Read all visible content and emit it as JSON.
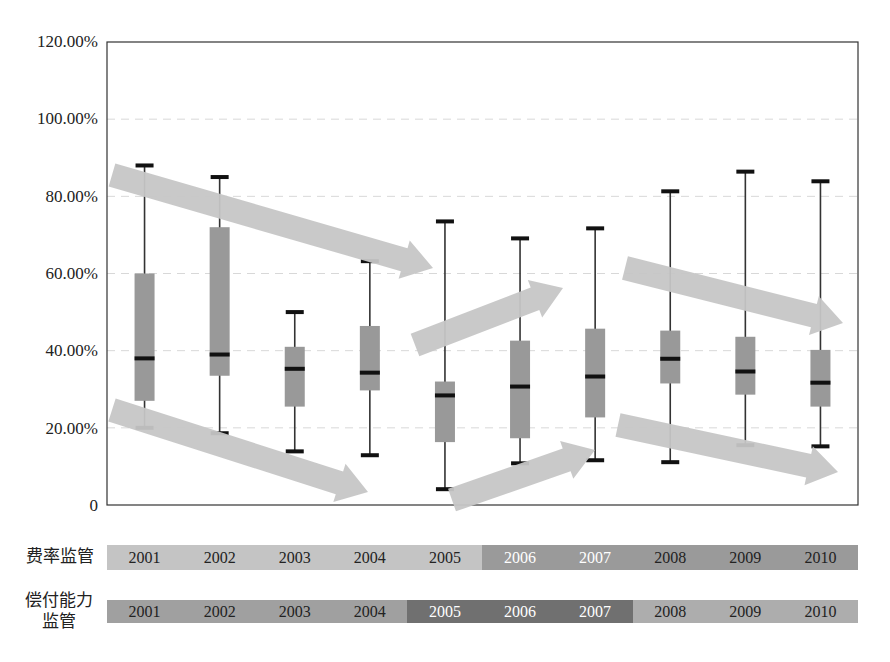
{
  "chart_data": {
    "type": "boxplot",
    "title": "",
    "xlabel": "",
    "ylabel": "",
    "ylim": [
      0,
      1.2
    ],
    "y_ticks": [
      "0",
      "20.00%",
      "40.00%",
      "60.00%",
      "80.00%",
      "100.00%",
      "120.00%"
    ],
    "grid": "horizontal dashed",
    "categories": [
      "2001",
      "2002",
      "2003",
      "2004",
      "2005",
      "2006",
      "2007",
      "2008",
      "2009",
      "2010"
    ],
    "boxes": [
      {
        "year": "2001",
        "max": 0.88,
        "q3": 0.6,
        "median": 0.38,
        "q1": 0.27,
        "min": 0.2
      },
      {
        "year": "2002",
        "max": 0.85,
        "q3": 0.72,
        "median": 0.39,
        "q1": 0.335,
        "min": 0.186
      },
      {
        "year": "2003",
        "max": 0.5,
        "q3": 0.41,
        "median": 0.353,
        "q1": 0.255,
        "min": 0.139
      },
      {
        "year": "2004",
        "max": 0.632,
        "q3": 0.464,
        "median": 0.343,
        "q1": 0.297,
        "min": 0.129
      },
      {
        "year": "2005",
        "max": 0.735,
        "q3": 0.32,
        "median": 0.284,
        "q1": 0.163,
        "min": 0.041
      },
      {
        "year": "2006",
        "max": 0.691,
        "q3": 0.426,
        "median": 0.307,
        "q1": 0.173,
        "min": 0.108
      },
      {
        "year": "2007",
        "max": 0.717,
        "q3": 0.457,
        "median": 0.333,
        "q1": 0.227,
        "min": 0.116
      },
      {
        "year": "2008",
        "max": 0.813,
        "q3": 0.452,
        "median": 0.379,
        "q1": 0.315,
        "min": 0.111
      },
      {
        "year": "2009",
        "max": 0.864,
        "q3": 0.436,
        "median": 0.346,
        "q1": 0.286,
        "min": 0.155
      },
      {
        "year": "2010",
        "max": 0.839,
        "q3": 0.402,
        "median": 0.317,
        "q1": 0.255,
        "min": 0.152
      }
    ],
    "annotations": [
      {
        "type": "arrow",
        "direction": "down",
        "from": [
          112,
          175
        ],
        "to": [
          433,
          268
        ]
      },
      {
        "type": "arrow",
        "direction": "down",
        "from": [
          112,
          410
        ],
        "to": [
          368,
          492
        ]
      },
      {
        "type": "arrow",
        "direction": "up",
        "from": [
          415,
          345
        ],
        "to": [
          563,
          288
        ]
      },
      {
        "type": "arrow",
        "direction": "up",
        "from": [
          452,
          500
        ],
        "to": [
          595,
          450
        ]
      },
      {
        "type": "arrow",
        "direction": "down",
        "from": [
          625,
          268
        ],
        "to": [
          843,
          323
        ]
      },
      {
        "type": "arrow",
        "direction": "down",
        "from": [
          618,
          425
        ],
        "to": [
          838,
          472
        ]
      }
    ],
    "timelines": [
      {
        "label": "费率监管",
        "segments": [
          {
            "years": [
              "2001",
              "2002",
              "2003",
              "2004",
              "2005"
            ],
            "color": "#c4c4c4",
            "text_color": "#222222"
          },
          {
            "years": [
              "2006",
              "2007"
            ],
            "color": "#9a9a9a",
            "text_color": "#ffffff"
          },
          {
            "years": [
              "2008",
              "2009",
              "2010"
            ],
            "color": "#9a9a9a",
            "text_color": "#222222"
          }
        ]
      },
      {
        "label": "偿付能力监管",
        "segments": [
          {
            "years": [
              "2001",
              "2002",
              "2003",
              "2004"
            ],
            "color": "#a0a0a0",
            "text_color": "#222222"
          },
          {
            "years": [
              "2005",
              "2006",
              "2007"
            ],
            "color": "#707070",
            "text_color": "#ffffff"
          },
          {
            "years": [
              "2008",
              "2009",
              "2010"
            ],
            "color": "#adadad",
            "text_color": "#222222"
          }
        ]
      }
    ]
  },
  "y_labels": {
    "t0": "0",
    "t20": "20.00%",
    "t40": "40.00%",
    "t60": "60.00%",
    "t80": "80.00%",
    "t100": "100.00%",
    "t120": "120.00%"
  },
  "timeline": {
    "row1_label": "费率监管",
    "row2_label_line1": "偿付能力",
    "row2_label_line2": "监管",
    "years": [
      "2001",
      "2002",
      "2003",
      "2004",
      "2005",
      "2006",
      "2007",
      "2008",
      "2009",
      "2010"
    ]
  },
  "colors": {
    "box": "#999999",
    "arrow": "#c6c6c6",
    "median": "#111111",
    "grid": "#d8d8d8"
  }
}
